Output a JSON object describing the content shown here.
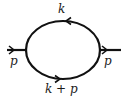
{
  "diagram": {
    "type": "feynman-one-loop-bubble",
    "external_lines": [
      {
        "id": "left",
        "label": "p",
        "direction": "right"
      },
      {
        "id": "right",
        "label": "p",
        "direction": "right"
      }
    ],
    "internal_lines": [
      {
        "id": "top",
        "label": "k",
        "direction": "left"
      },
      {
        "id": "bottom",
        "label": "k + p",
        "direction": "right"
      }
    ],
    "colors": {
      "line": "#111111",
      "background": "#ffffff"
    }
  }
}
